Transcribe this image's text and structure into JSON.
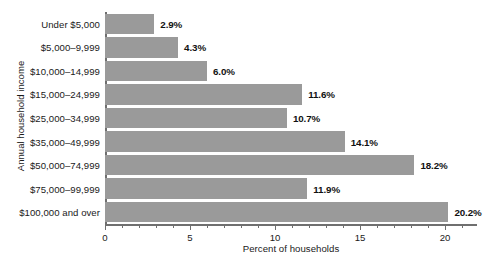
{
  "chart_data": {
    "type": "bar",
    "orientation": "horizontal",
    "title": "",
    "xlabel": "Percent of households",
    "ylabel": "Annual household income",
    "categories": [
      "Under $5,000",
      "$5,000–9,999",
      "$10,000–14,999",
      "$15,000–24,999",
      "$25,000–34,999",
      "$35,000–49,999",
      "$50,000–74,999",
      "$75,000–99,999",
      "$100,000 and over"
    ],
    "values": [
      2.9,
      4.3,
      6.0,
      11.6,
      10.7,
      14.1,
      18.2,
      11.9,
      20.2
    ],
    "data_labels": [
      "2.9%",
      "4.3%",
      "6.0%",
      "11.6%",
      "10.7%",
      "14.1%",
      "18.2%",
      "11.9%",
      "20.2%"
    ],
    "xlim": [
      0,
      22
    ],
    "xticks": [
      0,
      5,
      10,
      15,
      20
    ],
    "xtick_labels": [
      "0",
      "5",
      "10",
      "15",
      "20"
    ],
    "minor_tick_step": 1,
    "grid": false,
    "legend": false,
    "bar_color": "#9a9a9a",
    "axis_color": "#6f6f6f",
    "text_color": "#1a1a1a"
  }
}
